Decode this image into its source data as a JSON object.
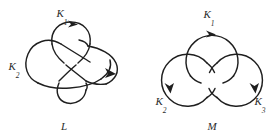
{
  "figure": {
    "background_color": "#ffffff",
    "ink_color": "#1f1f1f",
    "label_color": "#2b2b2b",
    "width": 279,
    "height": 140,
    "panels": [
      {
        "id": "left",
        "name": "whitehead-link",
        "caption": "L",
        "component_labels": [
          {
            "id": "k1",
            "base": "K",
            "sub": "1",
            "text": "K₁",
            "x": 62,
            "y": 17
          },
          {
            "id": "k2",
            "base": "K",
            "sub": "2",
            "text": "K₂",
            "x": 14,
            "y": 70
          }
        ],
        "caption_pos": {
          "x": 64,
          "y": 128
        },
        "arrow_count": 2,
        "crossing_count": 5
      },
      {
        "id": "right",
        "name": "borromean-rings",
        "caption": "M",
        "component_labels": [
          {
            "id": "k1",
            "base": "K",
            "sub": "1",
            "text": "K₁",
            "x": 207,
            "y": 18
          },
          {
            "id": "k2",
            "base": "K",
            "sub": "2",
            "text": "K₂",
            "x": 163,
            "y": 103
          },
          {
            "id": "k3",
            "base": "K",
            "sub": "3",
            "text": "K₃",
            "x": 251,
            "y": 103
          }
        ],
        "caption_pos": {
          "x": 212,
          "y": 128
        },
        "arrow_count": 3,
        "circles": [
          {
            "id": "top",
            "cx": 212,
            "cy": 58,
            "r": 26
          },
          {
            "id": "left",
            "cx": 190,
            "cy": 80,
            "r": 26
          },
          {
            "id": "right",
            "cx": 234,
            "cy": 80,
            "r": 26
          }
        ]
      }
    ]
  }
}
